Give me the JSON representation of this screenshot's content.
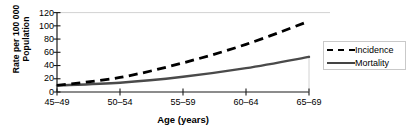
{
  "chart_data": {
    "type": "line",
    "title": "",
    "xlabel": "Age (years)",
    "ylabel": "Rate per 100 000 Population",
    "ylabel_line1": "Rate per 100 000",
    "ylabel_line2": "Population",
    "categories": [
      "45–49",
      "50–54",
      "55–59",
      "60–64",
      "65–69"
    ],
    "yticks": [
      "0",
      "20",
      "40",
      "60",
      "80",
      "100",
      "120"
    ],
    "ytick_values": [
      0,
      20,
      40,
      60,
      80,
      100,
      120
    ],
    "ylim": [
      0,
      120
    ],
    "grid": false,
    "legend_position": "right",
    "series": [
      {
        "name": "Incidence",
        "style": "dashed",
        "color": "#000000",
        "values": [
          10,
          22,
          44,
          72,
          107
        ]
      },
      {
        "name": "Mortality",
        "style": "solid",
        "color": "#4a4a4a",
        "values": [
          10,
          14,
          23,
          36,
          53
        ]
      }
    ]
  },
  "legend": {
    "items": [
      {
        "label": "Incidence",
        "key": "dashed-line-key"
      },
      {
        "label": "Mortality",
        "key": "solid-line-key"
      }
    ]
  },
  "colors": {
    "incidence": "#000000",
    "mortality": "#4a4a4a",
    "axis": "#1a1a1a",
    "legend_border": "#c9c9c9",
    "background": "#ffffff"
  }
}
